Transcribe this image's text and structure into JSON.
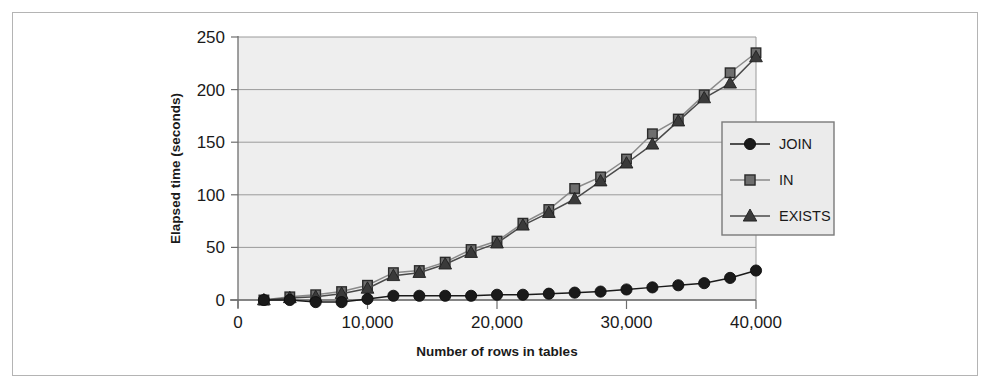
{
  "chart_data": {
    "type": "line",
    "title": "",
    "xlabel": "Number of rows in tables",
    "ylabel": "Elapsed time (seconds)",
    "xlim": [
      0,
      40000
    ],
    "ylim": [
      0,
      250
    ],
    "xticks": [
      0,
      10000,
      20000,
      30000,
      40000
    ],
    "xtick_labels": [
      "0",
      "10,000",
      "20,000",
      "30,000",
      "40,000"
    ],
    "yticks": [
      0,
      50,
      100,
      150,
      200,
      250
    ],
    "ytick_labels": [
      "0",
      "50",
      "100",
      "150",
      "200",
      "250"
    ],
    "grid": "horizontal",
    "legend_position": "right",
    "plot_background": "#ebebeb",
    "x": [
      2000,
      4000,
      6000,
      8000,
      10000,
      12000,
      14000,
      16000,
      18000,
      20000,
      22000,
      24000,
      26000,
      28000,
      30000,
      32000,
      34000,
      36000,
      38000,
      40000
    ],
    "series": [
      {
        "name": "JOIN",
        "marker": "circle",
        "color": "#1a1a1a",
        "values": [
          0,
          0,
          -2,
          -2,
          1,
          4,
          4,
          4,
          4,
          5,
          5,
          6,
          7,
          8,
          10,
          12,
          14,
          16,
          21,
          28
        ]
      },
      {
        "name": "IN",
        "marker": "square",
        "color": "#6e6e6e",
        "values": [
          0,
          3,
          5,
          8,
          14,
          26,
          28,
          36,
          48,
          56,
          73,
          86,
          106,
          117,
          134,
          158,
          172,
          195,
          216,
          235
        ]
      },
      {
        "name": "EXISTS",
        "marker": "triangle",
        "color": "#3a3a3a",
        "values": [
          0,
          2,
          3,
          6,
          11,
          23,
          26,
          34,
          45,
          54,
          71,
          83,
          96,
          113,
          130,
          148,
          170,
          192,
          206,
          231
        ]
      }
    ]
  },
  "legend": {
    "items": [
      {
        "label": "JOIN",
        "marker": "circle-icon"
      },
      {
        "label": "IN",
        "marker": "square-icon"
      },
      {
        "label": "EXISTS",
        "marker": "triangle-icon"
      }
    ]
  }
}
